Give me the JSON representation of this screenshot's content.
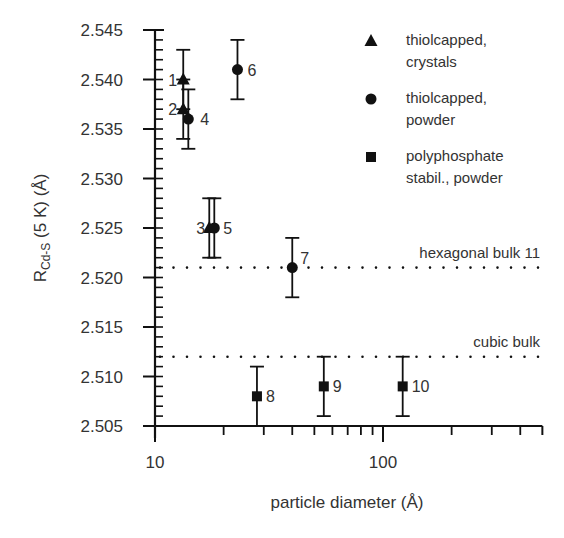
{
  "chart_data": {
    "type": "scatter",
    "title": "",
    "xlabel": "particle diameter (Å)",
    "ylabel_main": "R",
    "ylabel_sub": "Cd-S",
    "ylabel_rest": " (5 K) (Å)",
    "xscale": "log",
    "xlim": [
      10,
      500
    ],
    "ylim": [
      2.505,
      2.545
    ],
    "x_tick_labels": [
      {
        "value": 10,
        "label": "10"
      },
      {
        "value": 100,
        "label": "100"
      }
    ],
    "y_ticks": [
      2.505,
      2.51,
      2.515,
      2.52,
      2.525,
      2.53,
      2.535,
      2.54,
      2.545
    ],
    "y_tick_labels": [
      "2.505",
      "2.510",
      "2.515",
      "2.520",
      "2.525",
      "2.530",
      "2.535",
      "2.540",
      "2.545"
    ],
    "grid": false,
    "legend_position": "upper right",
    "series": [
      {
        "name": "thiolcapped, crystals",
        "legend_lines": [
          "thiolcapped,",
          "crystals"
        ],
        "marker": "triangle",
        "points": [
          {
            "label": "1",
            "x": 13.3,
            "y": 2.54,
            "err_low": 2.537,
            "err_high": 2.543
          },
          {
            "label": "2",
            "x": 13.3,
            "y": 2.537,
            "err_low": 2.534,
            "err_high": 2.54
          },
          {
            "label": "3",
            "x": 17.3,
            "y": 2.525,
            "err_low": 2.522,
            "err_high": 2.528
          }
        ]
      },
      {
        "name": "thiolcapped, powder",
        "legend_lines": [
          "thiolcapped,",
          "powder"
        ],
        "marker": "circle",
        "points": [
          {
            "label": "4",
            "x": 14.0,
            "y": 2.536,
            "err_low": 2.533,
            "err_high": 2.539
          },
          {
            "label": "5",
            "x": 18.2,
            "y": 2.525,
            "err_low": 2.522,
            "err_high": 2.528
          },
          {
            "label": "6",
            "x": 23.0,
            "y": 2.541,
            "err_low": 2.538,
            "err_high": 2.544
          },
          {
            "label": "7",
            "x": 40.0,
            "y": 2.521,
            "err_low": 2.518,
            "err_high": 2.524
          }
        ]
      },
      {
        "name": "polyphosphate stabil., powder",
        "legend_lines": [
          "polyphosphate",
          "stabil., powder"
        ],
        "marker": "square",
        "points": [
          {
            "label": "8",
            "x": 28.0,
            "y": 2.508,
            "err_low": 2.505,
            "err_high": 2.511
          },
          {
            "label": "9",
            "x": 55.0,
            "y": 2.509,
            "err_low": 2.506,
            "err_high": 2.512
          },
          {
            "label": "10",
            "x": 122.0,
            "y": 2.509,
            "err_low": 2.506,
            "err_high": 2.512
          }
        ]
      }
    ],
    "reference_lines": [
      {
        "label": "hexagonal bulk 11",
        "y": 2.521,
        "style": "dotted"
      },
      {
        "label": "cubic bulk",
        "y": 2.512,
        "style": "dotted"
      }
    ]
  }
}
